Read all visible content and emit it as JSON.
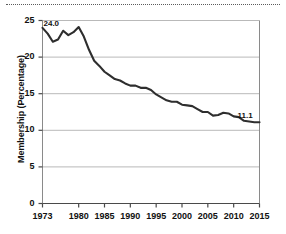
{
  "figure": {
    "name": "union-membership-line-chart",
    "decorations": {
      "top_rule": "dotted-horizontal-rule"
    }
  },
  "chart_data": {
    "type": "line",
    "title": "",
    "xlabel": "",
    "ylabel": "Membership (Percentage)",
    "xlim": [
      1973,
      2015
    ],
    "ylim": [
      0,
      25
    ],
    "grid": "horizontal",
    "legend": "none",
    "line_color": "#2e2e2e",
    "xticks": [
      "1973",
      "1980",
      "1985",
      "1990",
      "1995",
      "2000",
      "2005",
      "2010",
      "2015"
    ],
    "xtick_values": [
      1973,
      1980,
      1985,
      1990,
      1995,
      2000,
      2005,
      2010,
      2015
    ],
    "yticks": [
      "0",
      "5",
      "10",
      "15",
      "20",
      "25"
    ],
    "ytick_values": [
      0,
      5,
      10,
      15,
      20,
      25
    ],
    "annotations": [
      {
        "text": "24.0",
        "x": 1973,
        "y": 24.0
      },
      {
        "text": "11.1",
        "x": 2015,
        "y": 11.1
      }
    ],
    "x": [
      1973,
      1974,
      1975,
      1976,
      1977,
      1978,
      1979,
      1980,
      1981,
      1982,
      1983,
      1984,
      1985,
      1986,
      1987,
      1988,
      1989,
      1990,
      1991,
      1992,
      1993,
      1994,
      1995,
      1996,
      1997,
      1998,
      1999,
      2000,
      2001,
      2002,
      2003,
      2004,
      2005,
      2006,
      2007,
      2008,
      2009,
      2010,
      2011,
      2012,
      2013,
      2014,
      2015
    ],
    "values": [
      24.0,
      23.2,
      22.1,
      22.4,
      23.6,
      23.0,
      23.4,
      24.1,
      22.8,
      21.0,
      19.5,
      18.8,
      18.0,
      17.5,
      17.0,
      16.8,
      16.4,
      16.1,
      16.1,
      15.8,
      15.8,
      15.5,
      14.9,
      14.5,
      14.1,
      13.9,
      13.9,
      13.5,
      13.4,
      13.3,
      12.9,
      12.5,
      12.5,
      12.0,
      12.1,
      12.4,
      12.3,
      11.9,
      11.8,
      11.3,
      11.2,
      11.1,
      11.1
    ]
  }
}
